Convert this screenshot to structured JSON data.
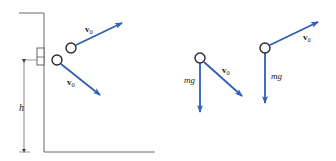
{
  "figure": {
    "colors": {
      "vector": "#2f5fb8",
      "line": "#6b6b6b",
      "ball_outline": "#2a2a2a",
      "text": "#1a1a1a"
    }
  },
  "cliff_scene": {
    "height_label": "h",
    "upper_ball": {
      "velocity_label_main": "v",
      "velocity_label_sub": "0"
    },
    "lower_ball": {
      "velocity_label_main": "v",
      "velocity_label_sub": "0"
    }
  },
  "fbd_downward": {
    "weight_label": "mg",
    "velocity_label_main": "v",
    "velocity_label_sub": "0"
  },
  "fbd_upward": {
    "weight_label": "mg",
    "velocity_label_main": "v",
    "velocity_label_sub": "0"
  }
}
